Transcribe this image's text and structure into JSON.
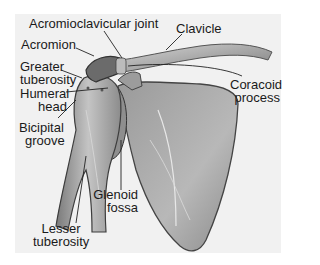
{
  "figure": {
    "background_color": "#f1f1f1",
    "labels": {
      "acromioclavicular_joint": "Acromioclavicular joint",
      "clavicle": "Clavicle",
      "acromion": "Acromion",
      "greater_tuberosity_1": "Greater",
      "greater_tuberosity_2": "tuberosity",
      "coracoid_process_1": "Coracoid",
      "coracoid_process_2": "process",
      "humeral_head_1": "Humeral",
      "humeral_head_2": "head",
      "bicipital_groove_1": "Bicipital",
      "bicipital_groove_2": "groove",
      "glenoid_fossa_1": "Glenoid",
      "glenoid_fossa_2": "fossa",
      "lesser_tuberosity_1": "Lesser",
      "lesser_tuberosity_2": "tuberosity"
    }
  }
}
